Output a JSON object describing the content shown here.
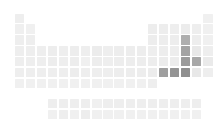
{
  "figure": {
    "kind": "periodic-table-heatmap",
    "title": "",
    "background_color": "#ffffff",
    "width": 220,
    "height": 138
  },
  "layout": {
    "cell_size": 9.4,
    "cell_pitch_x": 11.1,
    "cell_pitch_y": 10.9,
    "main_origin_x": 14.5,
    "main_origin_y": 13.5,
    "fblock_origin_x": 47.8,
    "fblock_origin_y": 99.0,
    "fblock_row_pitch_y": 11.0
  },
  "chart_data": {
    "type": "heatmap",
    "title": "",
    "xlabel": "",
    "ylabel": "",
    "grid": false,
    "legend": "none",
    "colorscale": {
      "name": "greys",
      "min_color": "#f2f2f2",
      "max_color": "#8c8c8c",
      "vmin": 0,
      "vmax": 1
    },
    "x": "group (1-18)",
    "y": "period (1-7), plus lanthanide and actinide rows",
    "cells": [
      {
        "symbol": "H",
        "group": 1,
        "period": 1,
        "value": 0.06,
        "color": "#eeeeee"
      },
      {
        "symbol": "He",
        "group": 18,
        "period": 1,
        "value": 0.05,
        "color": "#f0f0f0"
      },
      {
        "symbol": "Li",
        "group": 1,
        "period": 2,
        "value": 0.06,
        "color": "#efefef"
      },
      {
        "symbol": "Be",
        "group": 2,
        "period": 2,
        "value": 0.05,
        "color": "#f0f0f0"
      },
      {
        "symbol": "B",
        "group": 13,
        "period": 2,
        "value": 0.07,
        "color": "#ededed"
      },
      {
        "symbol": "C",
        "group": 14,
        "period": 2,
        "value": 0.07,
        "color": "#ededed"
      },
      {
        "symbol": "N",
        "group": 15,
        "period": 2,
        "value": 0.06,
        "color": "#eeeeee"
      },
      {
        "symbol": "O",
        "group": 16,
        "period": 2,
        "value": 0.08,
        "color": "#ececec"
      },
      {
        "symbol": "F",
        "group": 17,
        "period": 2,
        "value": 0.06,
        "color": "#eeeeee"
      },
      {
        "symbol": "Ne",
        "group": 18,
        "period": 2,
        "value": 0.05,
        "color": "#f0f0f0"
      },
      {
        "symbol": "Na",
        "group": 1,
        "period": 3,
        "value": 0.06,
        "color": "#eeeeee"
      },
      {
        "symbol": "Mg",
        "group": 2,
        "period": 3,
        "value": 0.06,
        "color": "#eeeeee"
      },
      {
        "symbol": "Al",
        "group": 13,
        "period": 3,
        "value": 0.07,
        "color": "#ededed"
      },
      {
        "symbol": "Si",
        "group": 14,
        "period": 3,
        "value": 0.07,
        "color": "#ededed"
      },
      {
        "symbol": "P",
        "group": 15,
        "period": 3,
        "value": 0.07,
        "color": "#ededed"
      },
      {
        "symbol": "S",
        "group": 16,
        "period": 3,
        "value": 0.46,
        "color": "#aeaeae"
      },
      {
        "symbol": "Cl",
        "group": 17,
        "period": 3,
        "value": 0.07,
        "color": "#ededed"
      },
      {
        "symbol": "Ar",
        "group": 18,
        "period": 3,
        "value": 0.05,
        "color": "#f0f0f0"
      },
      {
        "symbol": "K",
        "group": 1,
        "period": 4,
        "value": 0.06,
        "color": "#eeeeee"
      },
      {
        "symbol": "Ca",
        "group": 2,
        "period": 4,
        "value": 0.06,
        "color": "#eeeeee"
      },
      {
        "symbol": "Sc",
        "group": 3,
        "period": 4,
        "value": 0.06,
        "color": "#eeeeee"
      },
      {
        "symbol": "Ti",
        "group": 4,
        "period": 4,
        "value": 0.07,
        "color": "#ededed"
      },
      {
        "symbol": "V",
        "group": 5,
        "period": 4,
        "value": 0.06,
        "color": "#eeeeee"
      },
      {
        "symbol": "Cr",
        "group": 6,
        "period": 4,
        "value": 0.07,
        "color": "#ededed"
      },
      {
        "symbol": "Mn",
        "group": 7,
        "period": 4,
        "value": 0.06,
        "color": "#eeeeee"
      },
      {
        "symbol": "Fe",
        "group": 8,
        "period": 4,
        "value": 0.08,
        "color": "#ececec"
      },
      {
        "symbol": "Co",
        "group": 9,
        "period": 4,
        "value": 0.06,
        "color": "#eeeeee"
      },
      {
        "symbol": "Ni",
        "group": 10,
        "period": 4,
        "value": 0.07,
        "color": "#ededed"
      },
      {
        "symbol": "Cu",
        "group": 11,
        "period": 4,
        "value": 0.07,
        "color": "#ededed"
      },
      {
        "symbol": "Zn",
        "group": 12,
        "period": 4,
        "value": 0.07,
        "color": "#ededed"
      },
      {
        "symbol": "Ga",
        "group": 13,
        "period": 4,
        "value": 0.06,
        "color": "#eeeeee"
      },
      {
        "symbol": "Ge",
        "group": 14,
        "period": 4,
        "value": 0.07,
        "color": "#ededed"
      },
      {
        "symbol": "As",
        "group": 15,
        "period": 4,
        "value": 0.07,
        "color": "#ededed"
      },
      {
        "symbol": "Se",
        "group": 16,
        "period": 4,
        "value": 0.55,
        "color": "#a3a3a3"
      },
      {
        "symbol": "Br",
        "group": 17,
        "period": 4,
        "value": 0.1,
        "color": "#e8e8e8"
      },
      {
        "symbol": "Kr",
        "group": 18,
        "period": 4,
        "value": 0.06,
        "color": "#eeeeee"
      },
      {
        "symbol": "Rb",
        "group": 1,
        "period": 5,
        "value": 0.06,
        "color": "#eeeeee"
      },
      {
        "symbol": "Sr",
        "group": 2,
        "period": 5,
        "value": 0.06,
        "color": "#eeeeee"
      },
      {
        "symbol": "Y",
        "group": 3,
        "period": 5,
        "value": 0.06,
        "color": "#eeeeee"
      },
      {
        "symbol": "Zr",
        "group": 4,
        "period": 5,
        "value": 0.07,
        "color": "#ededed"
      },
      {
        "symbol": "Nb",
        "group": 5,
        "period": 5,
        "value": 0.06,
        "color": "#eeeeee"
      },
      {
        "symbol": "Mo",
        "group": 6,
        "period": 5,
        "value": 0.07,
        "color": "#ededed"
      },
      {
        "symbol": "Tc",
        "group": 7,
        "period": 5,
        "value": 0.05,
        "color": "#f0f0f0"
      },
      {
        "symbol": "Ru",
        "group": 8,
        "period": 5,
        "value": 0.07,
        "color": "#ededed"
      },
      {
        "symbol": "Rh",
        "group": 9,
        "period": 5,
        "value": 0.06,
        "color": "#eeeeee"
      },
      {
        "symbol": "Pd",
        "group": 10,
        "period": 5,
        "value": 0.07,
        "color": "#ededed"
      },
      {
        "symbol": "Ag",
        "group": 11,
        "period": 5,
        "value": 0.07,
        "color": "#ededed"
      },
      {
        "symbol": "Cd",
        "group": 12,
        "period": 5,
        "value": 0.07,
        "color": "#ededed"
      },
      {
        "symbol": "In",
        "group": 13,
        "period": 5,
        "value": 0.07,
        "color": "#ededed"
      },
      {
        "symbol": "Sn",
        "group": 14,
        "period": 5,
        "value": 0.08,
        "color": "#ececec"
      },
      {
        "symbol": "Sb",
        "group": 15,
        "period": 5,
        "value": 0.08,
        "color": "#ececec"
      },
      {
        "symbol": "Te",
        "group": 16,
        "period": 5,
        "value": 0.62,
        "color": "#9b9b9b"
      },
      {
        "symbol": "I",
        "group": 17,
        "period": 5,
        "value": 0.52,
        "color": "#a8a8a8"
      },
      {
        "symbol": "Xe",
        "group": 18,
        "period": 5,
        "value": 0.09,
        "color": "#eaeaea"
      },
      {
        "symbol": "Cs",
        "group": 1,
        "period": 6,
        "value": 0.06,
        "color": "#eeeeee"
      },
      {
        "symbol": "Ba",
        "group": 2,
        "period": 6,
        "value": 0.06,
        "color": "#eeeeee"
      },
      {
        "symbol": "Lu",
        "group": 3,
        "period": 6,
        "value": 0.06,
        "color": "#eeeeee"
      },
      {
        "symbol": "Hf",
        "group": 4,
        "period": 6,
        "value": 0.06,
        "color": "#eeeeee"
      },
      {
        "symbol": "Ta",
        "group": 5,
        "period": 6,
        "value": 0.06,
        "color": "#eeeeee"
      },
      {
        "symbol": "W",
        "group": 6,
        "period": 6,
        "value": 0.07,
        "color": "#ededed"
      },
      {
        "symbol": "Re",
        "group": 7,
        "period": 6,
        "value": 0.06,
        "color": "#eeeeee"
      },
      {
        "symbol": "Os",
        "group": 8,
        "period": 6,
        "value": 0.06,
        "color": "#eeeeee"
      },
      {
        "symbol": "Ir",
        "group": 9,
        "period": 6,
        "value": 0.06,
        "color": "#eeeeee"
      },
      {
        "symbol": "Pt",
        "group": 10,
        "period": 6,
        "value": 0.07,
        "color": "#ededed"
      },
      {
        "symbol": "Au",
        "group": 11,
        "period": 6,
        "value": 0.07,
        "color": "#ededed"
      },
      {
        "symbol": "Hg",
        "group": 12,
        "period": 6,
        "value": 0.07,
        "color": "#ededed"
      },
      {
        "symbol": "Tl",
        "group": 13,
        "period": 6,
        "value": 0.08,
        "color": "#ececec"
      },
      {
        "symbol": "Pb",
        "group": 14,
        "period": 6,
        "value": 0.58,
        "color": "#9f9f9f"
      },
      {
        "symbol": "Bi",
        "group": 15,
        "period": 6,
        "value": 0.68,
        "color": "#949494"
      },
      {
        "symbol": "Po",
        "group": 16,
        "period": 6,
        "value": 0.72,
        "color": "#8f8f8f"
      },
      {
        "symbol": "At",
        "group": 17,
        "period": 6,
        "value": 0.1,
        "color": "#e8e8e8"
      },
      {
        "symbol": "Rn",
        "group": 18,
        "period": 6,
        "value": 0.06,
        "color": "#eeeeee"
      },
      {
        "symbol": "Fr",
        "group": 1,
        "period": 7,
        "value": 0.05,
        "color": "#f0f0f0"
      },
      {
        "symbol": "Ra",
        "group": 2,
        "period": 7,
        "value": 0.05,
        "color": "#f0f0f0"
      },
      {
        "symbol": "Lr",
        "group": 3,
        "period": 7,
        "value": 0.05,
        "color": "#f0f0f0"
      },
      {
        "symbol": "Rf",
        "group": 4,
        "period": 7,
        "value": 0.05,
        "color": "#f0f0f0"
      },
      {
        "symbol": "Db",
        "group": 5,
        "period": 7,
        "value": 0.05,
        "color": "#f0f0f0"
      },
      {
        "symbol": "Sg",
        "group": 6,
        "period": 7,
        "value": 0.05,
        "color": "#f0f0f0"
      },
      {
        "symbol": "Bh",
        "group": 7,
        "period": 7,
        "value": 0.05,
        "color": "#f0f0f0"
      },
      {
        "symbol": "Hs",
        "group": 8,
        "period": 7,
        "value": 0.05,
        "color": "#f0f0f0"
      },
      {
        "symbol": "Mt",
        "group": 9,
        "period": 7,
        "value": 0.05,
        "color": "#f0f0f0"
      },
      {
        "symbol": "Ds",
        "group": 10,
        "period": 7,
        "value": 0.05,
        "color": "#f0f0f0"
      },
      {
        "symbol": "Rg",
        "group": 11,
        "period": 7,
        "value": 0.05,
        "color": "#f0f0f0"
      },
      {
        "symbol": "Cn",
        "group": 12,
        "period": 7,
        "value": 0.05,
        "color": "#f0f0f0"
      },
      {
        "symbol": "Nh",
        "group": 13,
        "period": 7,
        "value": 0.06,
        "color": "#eeeeee"
      },
      {
        "symbol": "La",
        "group": 4,
        "period": 8,
        "value": 0.06,
        "color": "#eeeeee"
      },
      {
        "symbol": "Ce",
        "group": 5,
        "period": 8,
        "value": 0.06,
        "color": "#eeeeee"
      },
      {
        "symbol": "Pr",
        "group": 6,
        "period": 8,
        "value": 0.06,
        "color": "#eeeeee"
      },
      {
        "symbol": "Nd",
        "group": 7,
        "period": 8,
        "value": 0.06,
        "color": "#eeeeee"
      },
      {
        "symbol": "Pm",
        "group": 8,
        "period": 8,
        "value": 0.05,
        "color": "#f0f0f0"
      },
      {
        "symbol": "Sm",
        "group": 9,
        "period": 8,
        "value": 0.06,
        "color": "#eeeeee"
      },
      {
        "symbol": "Eu",
        "group": 10,
        "period": 8,
        "value": 0.06,
        "color": "#eeeeee"
      },
      {
        "symbol": "Gd",
        "group": 11,
        "period": 8,
        "value": 0.06,
        "color": "#eeeeee"
      },
      {
        "symbol": "Tb",
        "group": 12,
        "period": 8,
        "value": 0.06,
        "color": "#eeeeee"
      },
      {
        "symbol": "Dy",
        "group": 13,
        "period": 8,
        "value": 0.06,
        "color": "#eeeeee"
      },
      {
        "symbol": "Ho",
        "group": 14,
        "period": 8,
        "value": 0.06,
        "color": "#eeeeee"
      },
      {
        "symbol": "Er",
        "group": 15,
        "period": 8,
        "value": 0.06,
        "color": "#eeeeee"
      },
      {
        "symbol": "Tm",
        "group": 16,
        "period": 8,
        "value": 0.06,
        "color": "#eeeeee"
      },
      {
        "symbol": "Yb",
        "group": 17,
        "period": 8,
        "value": 0.06,
        "color": "#eeeeee"
      },
      {
        "symbol": "Ac",
        "group": 4,
        "period": 9,
        "value": 0.05,
        "color": "#f0f0f0"
      },
      {
        "symbol": "Th",
        "group": 5,
        "period": 9,
        "value": 0.06,
        "color": "#eeeeee"
      },
      {
        "symbol": "Pa",
        "group": 6,
        "period": 9,
        "value": 0.05,
        "color": "#f0f0f0"
      },
      {
        "symbol": "U",
        "group": 7,
        "period": 9,
        "value": 0.07,
        "color": "#ededed"
      },
      {
        "symbol": "Np",
        "group": 8,
        "period": 9,
        "value": 0.05,
        "color": "#f0f0f0"
      },
      {
        "symbol": "Pu",
        "group": 9,
        "period": 9,
        "value": 0.05,
        "color": "#f0f0f0"
      },
      {
        "symbol": "Am",
        "group": 10,
        "period": 9,
        "value": 0.05,
        "color": "#f0f0f0"
      },
      {
        "symbol": "Cm",
        "group": 11,
        "period": 9,
        "value": 0.05,
        "color": "#f0f0f0"
      },
      {
        "symbol": "Bk",
        "group": 12,
        "period": 9,
        "value": 0.05,
        "color": "#f0f0f0"
      },
      {
        "symbol": "Cf",
        "group": 13,
        "period": 9,
        "value": 0.05,
        "color": "#f0f0f0"
      },
      {
        "symbol": "Es",
        "group": 14,
        "period": 9,
        "value": 0.05,
        "color": "#f0f0f0"
      },
      {
        "symbol": "Fm",
        "group": 15,
        "period": 9,
        "value": 0.05,
        "color": "#f0f0f0"
      },
      {
        "symbol": "Md",
        "group": 16,
        "period": 9,
        "value": 0.05,
        "color": "#f0f0f0"
      },
      {
        "symbol": "No",
        "group": 17,
        "period": 9,
        "value": 0.05,
        "color": "#f0f0f0"
      }
    ]
  }
}
